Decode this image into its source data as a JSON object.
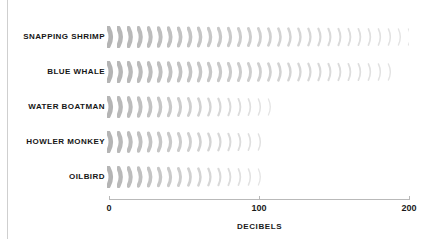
{
  "chart_title": "",
  "axis": {
    "x_title": "DECIBELS",
    "ticks": [
      {
        "label": "0",
        "value": 0
      },
      {
        "label": "100",
        "value": 100
      },
      {
        "label": "200",
        "value": 200
      }
    ]
  },
  "rows": [
    {
      "label": "SNAPPING SHRIMP",
      "value": 200
    },
    {
      "label": "BLUE WHALE",
      "value": 188
    },
    {
      "label": "WATER BOATMAN",
      "value": 109
    },
    {
      "label": "HOWLER MONKEY",
      "value": 105
    },
    {
      "label": "OILBIRD",
      "value": 103
    }
  ],
  "colors": {
    "arc_dark": "#b4b4b4",
    "arc_light": "#e4e4e4",
    "axis": "#b9b9b9",
    "label_text": "#161616",
    "frame": "#cfcfcf",
    "background": "#ffffff"
  },
  "chart_data": {
    "type": "bar",
    "orientation": "horizontal",
    "title": "",
    "xlabel": "DECIBELS",
    "ylabel": "",
    "categories": [
      "SNAPPING SHRIMP",
      "BLUE WHALE",
      "WATER BOATMAN",
      "HOWLER MONKEY",
      "OILBIRD"
    ],
    "values": [
      200,
      188,
      109,
      105,
      103
    ],
    "xlim": [
      0,
      200
    ],
    "xticks": [
      0,
      100,
      200
    ],
    "grid": false,
    "legend": false,
    "bar_style": "sound-wave-arc-glyphs-fading-left-to-right"
  }
}
